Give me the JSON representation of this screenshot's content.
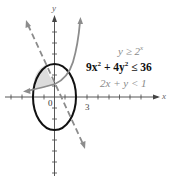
{
  "figure": {
    "axes": {
      "x_label": "x",
      "y_label": "y",
      "origin_label": "0",
      "x_tick_label": "3"
    },
    "inequalities": [
      {
        "text_base": "y ≥ 2",
        "text_sup": "x",
        "style": "gray"
      },
      {
        "text_pre": "9x",
        "sup1": "2",
        "text_mid": " + 4y",
        "sup2": "2",
        "text_post": " ≤ 36",
        "style": "bold"
      },
      {
        "text": "2x + y < 1",
        "style": "gray"
      }
    ],
    "colors": {
      "ellipse": "#111111",
      "curve": "#8c8c8c",
      "dashed_line": "#8c8c8c",
      "shading": "#dcdcdc",
      "axes": "#444444"
    }
  }
}
